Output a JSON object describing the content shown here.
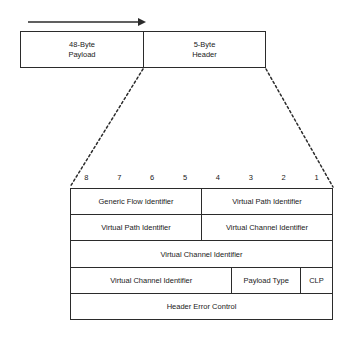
{
  "diagram": {
    "arrow": {
      "name": "transmission-direction-arrow",
      "direction": "right"
    },
    "cell": {
      "segments": [
        {
          "line1": "48-Byte",
          "line2": "Payload"
        },
        {
          "line1": "5-Byte",
          "line2": "Header"
        }
      ]
    },
    "bit_ruler": {
      "labels": [
        "8",
        "7",
        "6",
        "5",
        "4",
        "3",
        "2",
        "1"
      ]
    },
    "header_rows": [
      {
        "cells": [
          {
            "label": "Generic Flow Identifier",
            "bits": 4
          },
          {
            "label": "Virtual Path Identifier",
            "bits": 4
          }
        ]
      },
      {
        "cells": [
          {
            "label": "Virtual Path Identifier",
            "bits": 4
          },
          {
            "label": "Virtual Channel Identifier",
            "bits": 4
          }
        ]
      },
      {
        "cells": [
          {
            "label": "Virtual Channel Identifier",
            "bits": 8
          }
        ]
      },
      {
        "cells": [
          {
            "label": "Virtual Channel Identifier",
            "bits": 5
          },
          {
            "label": "Payload Type",
            "bits": 2
          },
          {
            "label": "CLP",
            "bits": 1
          }
        ]
      },
      {
        "cells": [
          {
            "label": "Header Error Control",
            "bits": 8
          }
        ]
      }
    ],
    "colors": {
      "line": "#2b2b2b",
      "text": "#1a1a1a",
      "background": "#ffffff"
    }
  }
}
